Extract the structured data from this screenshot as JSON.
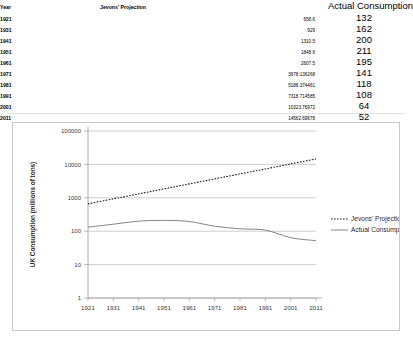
{
  "table": {
    "headers": {
      "year": "Year",
      "jevons": "Jevons' Projection",
      "actual": "Actual Consumption"
    },
    "rows": [
      {
        "year": "1921",
        "jevons": "658.6",
        "actual": "132"
      },
      {
        "year": "1931",
        "jevons": "929",
        "actual": "162"
      },
      {
        "year": "1941",
        "jevons": "1310.5",
        "actual": "200"
      },
      {
        "year": "1951",
        "jevons": "1848.6",
        "actual": "211"
      },
      {
        "year": "1961",
        "jevons": "2607.5",
        "actual": "195"
      },
      {
        "year": "1971",
        "jevons": "3678.136268",
        "actual": "141"
      },
      {
        "year": "1981",
        "jevons": "5188.374461",
        "actual": "118"
      },
      {
        "year": "1991",
        "jevons": "7318.714585",
        "actual": "108"
      },
      {
        "year": "2001",
        "jevons": "10323.76972",
        "actual": "64"
      },
      {
        "year": "2011",
        "jevons": "14562.69678",
        "actual": "52"
      }
    ]
  },
  "chart_data": {
    "type": "line",
    "title": "",
    "xlabel": "",
    "ylabel": "UK Consumption (millions of tons)",
    "x": [
      "1921",
      "1931",
      "1941",
      "1951",
      "1961",
      "1971",
      "1981",
      "1991",
      "2001",
      "2011"
    ],
    "xtick_labels": [
      "1921",
      "1931",
      "1941",
      "1951",
      "1961",
      "1971",
      "1981",
      "1991",
      "2001",
      "2011"
    ],
    "yscale": "log",
    "ylim": [
      1,
      100000
    ],
    "ytick_labels": [
      "1",
      "10",
      "100",
      "1000",
      "10000",
      "100000"
    ],
    "ytick_values": [
      1,
      10,
      100,
      1000,
      10000,
      100000
    ],
    "grid": true,
    "legend_position": "right",
    "series": [
      {
        "name": "Jevons' Projection",
        "style": "dotted",
        "color": "#1a1a1a",
        "values": [
          658.6,
          929,
          1310.5,
          1848.6,
          2607.5,
          3678.136268,
          5188.374461,
          7318.714585,
          10323.76972,
          14562.69678
        ]
      },
      {
        "name": "Actual Consumption",
        "style": "solid",
        "color": "#6e6e6e",
        "values": [
          132,
          162,
          200,
          211,
          195,
          141,
          118,
          108,
          64,
          52
        ]
      }
    ]
  },
  "legend": {
    "items": [
      {
        "label": "Jevons' Projection"
      },
      {
        "label": "Actual Consumption"
      }
    ]
  }
}
